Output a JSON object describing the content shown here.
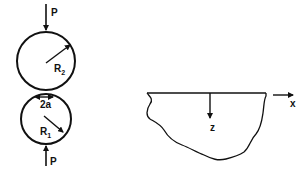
{
  "diagram": {
    "left_figure": {
      "upper_sphere": {
        "radius_label": "R",
        "radius_subscript": "2"
      },
      "lower_sphere": {
        "radius_label": "R",
        "radius_subscript": "1"
      },
      "top_load_label": "P",
      "bottom_load_label": "P",
      "contact_width_label": "2a"
    },
    "right_figure": {
      "surface_axis_label": "x",
      "depth_axis_label": "z"
    },
    "colors": {
      "line": "#111111",
      "background": "#ffffff"
    }
  }
}
